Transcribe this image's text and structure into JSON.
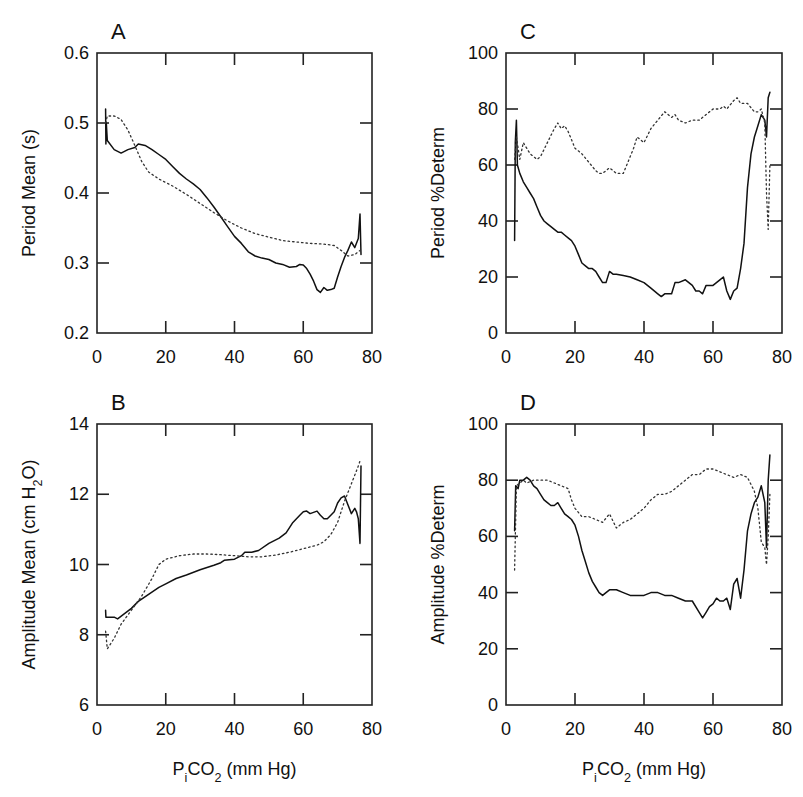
{
  "figure": {
    "panels": [
      "A",
      "B",
      "C",
      "D"
    ],
    "x_axis_label": "PiCO2 (mm Hg)"
  },
  "chart_data": [
    {
      "panel": "A",
      "type": "line",
      "title": "A",
      "xlabel": "",
      "ylabel": "Period  Mean (s)",
      "xlim": [
        0,
        80
      ],
      "ylim": [
        0.2,
        0.6
      ],
      "xticks": [
        0,
        20,
        40,
        60,
        80
      ],
      "yticks": [
        0.2,
        0.3,
        0.4,
        0.5,
        0.6
      ],
      "ytick_labels": [
        "0.2",
        "0.3",
        "0.4",
        "0.5",
        "0.6"
      ],
      "grid": false,
      "series": [
        {
          "name": "solid",
          "style": "solid",
          "x": [
            2.5,
            2.6,
            2.7,
            3,
            5,
            7,
            9,
            11,
            12,
            14,
            16,
            18,
            20,
            22,
            24,
            26,
            28,
            30,
            32,
            34,
            36,
            38,
            40,
            42,
            44,
            46,
            48,
            50,
            52,
            54,
            56,
            58,
            59,
            60,
            61,
            62,
            63,
            64,
            65,
            66,
            67,
            68,
            69,
            70,
            71,
            72,
            73,
            74,
            75,
            76,
            76.5,
            76.8
          ],
          "y": [
            0.52,
            0.47,
            0.5,
            0.475,
            0.462,
            0.457,
            0.462,
            0.465,
            0.47,
            0.468,
            0.462,
            0.455,
            0.448,
            0.438,
            0.428,
            0.42,
            0.413,
            0.405,
            0.393,
            0.38,
            0.366,
            0.352,
            0.338,
            0.328,
            0.316,
            0.31,
            0.307,
            0.305,
            0.3,
            0.298,
            0.294,
            0.295,
            0.298,
            0.297,
            0.292,
            0.284,
            0.274,
            0.262,
            0.258,
            0.265,
            0.261,
            0.262,
            0.264,
            0.28,
            0.295,
            0.308,
            0.318,
            0.33,
            0.322,
            0.335,
            0.37,
            0.312
          ]
        },
        {
          "name": "dotted",
          "style": "dotted",
          "x": [
            2.5,
            3,
            5,
            7,
            9,
            11,
            13,
            15,
            18,
            22,
            26,
            30,
            34,
            38,
            42,
            46,
            50,
            54,
            58,
            62,
            66,
            69,
            71,
            73,
            75,
            76.5
          ],
          "y": [
            0.5,
            0.51,
            0.51,
            0.505,
            0.49,
            0.468,
            0.445,
            0.43,
            0.42,
            0.41,
            0.398,
            0.385,
            0.372,
            0.36,
            0.35,
            0.342,
            0.337,
            0.332,
            0.33,
            0.328,
            0.327,
            0.325,
            0.318,
            0.31,
            0.312,
            0.318
          ]
        }
      ]
    },
    {
      "panel": "B",
      "type": "line",
      "title": "B",
      "xlabel": "PiCO2 (mm Hg)",
      "ylabel": "Amplitude  Mean (cm H2O)",
      "xlim": [
        0,
        80
      ],
      "ylim": [
        6,
        14
      ],
      "xticks": [
        0,
        20,
        40,
        60,
        80
      ],
      "yticks": [
        6,
        8,
        10,
        12,
        14
      ],
      "ytick_labels": [
        "6",
        "8",
        "10",
        "12",
        "14"
      ],
      "grid": false,
      "series": [
        {
          "name": "solid",
          "style": "solid",
          "x": [
            2.5,
            2.6,
            3,
            5,
            6,
            8,
            10,
            12,
            15,
            18,
            20,
            23,
            26,
            30,
            34,
            36,
            37,
            40,
            42,
            43,
            45,
            47,
            50,
            53,
            55,
            57,
            59,
            60,
            61,
            62,
            64,
            65,
            66,
            67,
            68,
            69,
            70,
            71,
            72,
            73,
            74,
            75,
            75.5,
            76,
            76.5,
            76.8
          ],
          "y": [
            8.7,
            8.5,
            8.5,
            8.5,
            8.45,
            8.6,
            8.75,
            8.95,
            9.15,
            9.35,
            9.45,
            9.6,
            9.7,
            9.85,
            9.98,
            10.05,
            10.12,
            10.15,
            10.25,
            10.35,
            10.35,
            10.4,
            10.6,
            10.75,
            10.9,
            11.2,
            11.4,
            11.5,
            11.52,
            11.45,
            11.52,
            11.4,
            11.3,
            11.3,
            11.4,
            11.5,
            11.75,
            11.9,
            11.95,
            11.7,
            11.45,
            11.6,
            11.5,
            11.3,
            10.6,
            12.8
          ]
        },
        {
          "name": "dotted",
          "style": "dotted",
          "x": [
            2.5,
            3,
            5,
            7,
            10,
            13,
            16,
            18,
            20,
            24,
            28,
            32,
            36,
            40,
            44,
            48,
            52,
            56,
            60,
            64,
            66,
            68,
            70,
            72,
            74,
            76,
            76.5
          ],
          "y": [
            8.1,
            7.6,
            7.9,
            8.3,
            8.7,
            9.1,
            9.6,
            10.0,
            10.15,
            10.25,
            10.3,
            10.3,
            10.28,
            10.25,
            10.22,
            10.22,
            10.27,
            10.35,
            10.45,
            10.55,
            10.65,
            10.85,
            11.2,
            11.8,
            12.3,
            12.8,
            12.95
          ]
        }
      ]
    },
    {
      "panel": "C",
      "type": "line",
      "title": "C",
      "xlabel": "",
      "ylabel": "Period  %Determ",
      "xlim": [
        0,
        80
      ],
      "ylim": [
        0,
        100
      ],
      "xticks": [
        0,
        20,
        40,
        60,
        80
      ],
      "yticks": [
        0,
        20,
        40,
        60,
        80,
        100
      ],
      "ytick_labels": [
        "0",
        "20",
        "40",
        "60",
        "80",
        "100"
      ],
      "grid": false,
      "series": [
        {
          "name": "solid",
          "style": "solid",
          "x": [
            2.5,
            2.7,
            3,
            3.3,
            4,
            5,
            6,
            7,
            8,
            9,
            10,
            11,
            12,
            13,
            14,
            15,
            16,
            17,
            18,
            19,
            20,
            21,
            22,
            23,
            24,
            25,
            26,
            27,
            28,
            29,
            30,
            31,
            32,
            34,
            36,
            38,
            40,
            42,
            44,
            45,
            46,
            48,
            49,
            50,
            52,
            54,
            55,
            56,
            57,
            58,
            60,
            62,
            63,
            64,
            65,
            66,
            67,
            68,
            69,
            70,
            71,
            72,
            73,
            74,
            75,
            75.5,
            76,
            76.5
          ],
          "y": [
            33,
            68,
            76,
            60,
            57,
            54,
            52,
            50,
            48,
            45,
            42,
            40,
            39,
            38,
            37,
            36,
            36,
            35,
            34,
            33,
            31,
            28,
            25,
            24,
            23,
            23,
            22,
            20,
            18,
            18,
            22,
            21,
            21,
            20.5,
            20,
            19,
            18,
            16,
            14,
            13,
            14,
            14,
            18,
            18,
            19,
            17,
            15,
            15,
            14,
            17,
            17,
            19,
            20,
            15,
            12,
            15,
            16,
            23,
            32,
            52,
            64,
            70,
            74,
            78,
            76,
            70,
            84,
            86
          ]
        },
        {
          "name": "dotted",
          "style": "dotted",
          "x": [
            2.5,
            3,
            4,
            5,
            6,
            7,
            8,
            9,
            10,
            12,
            14,
            15,
            16,
            17,
            18,
            20,
            22,
            24,
            26,
            27,
            28,
            30,
            32,
            34,
            36,
            37,
            38,
            39,
            40,
            42,
            44,
            46,
            48,
            49,
            50,
            52,
            54,
            56,
            58,
            60,
            62,
            63,
            64,
            66,
            67,
            68,
            70,
            72,
            73,
            74,
            75,
            75.5,
            76,
            76.5
          ],
          "y": [
            62,
            70,
            62,
            68,
            66,
            64,
            63,
            62,
            63,
            68,
            73,
            75,
            73,
            74,
            72,
            66,
            64,
            61,
            58,
            57,
            57,
            59,
            57,
            57,
            63,
            66,
            70,
            69,
            68,
            73,
            76,
            79,
            77,
            78,
            76,
            75,
            76,
            76,
            78,
            80,
            80,
            81,
            80,
            83,
            84,
            82,
            82,
            79,
            79,
            80,
            75,
            50,
            37,
            60
          ]
        }
      ]
    },
    {
      "panel": "D",
      "type": "line",
      "title": "D",
      "xlabel": "PiCO2 (mm Hg)",
      "ylabel": "Amplitude  %Determ",
      "xlim": [
        0,
        80
      ],
      "ylim": [
        0,
        100
      ],
      "xticks": [
        0,
        20,
        40,
        60,
        80
      ],
      "yticks": [
        0,
        20,
        40,
        60,
        80,
        100
      ],
      "ytick_labels": [
        "0",
        "20",
        "40",
        "60",
        "80",
        "100"
      ],
      "grid": false,
      "series": [
        {
          "name": "solid",
          "style": "solid",
          "x": [
            2.5,
            2.8,
            3.5,
            4,
            5,
            6,
            7,
            8,
            9,
            10,
            11,
            12,
            13,
            14,
            15,
            16,
            17,
            18,
            19,
            20,
            21,
            22,
            23,
            24,
            25,
            26,
            27,
            28,
            29,
            30,
            32,
            34,
            36,
            38,
            40,
            42,
            44,
            46,
            48,
            50,
            52,
            54,
            56,
            57,
            58,
            59,
            60,
            61,
            62,
            63,
            64,
            65,
            66,
            67,
            68,
            69,
            70,
            71,
            72,
            73,
            74,
            75,
            75.5,
            76,
            76.5
          ],
          "y": [
            62,
            78,
            77,
            80,
            80,
            81,
            80,
            78,
            77,
            75,
            73,
            72,
            71,
            71,
            72,
            70,
            68,
            67,
            66,
            64,
            60,
            55,
            51,
            47,
            44,
            42,
            40,
            39,
            40,
            41,
            41,
            40,
            39,
            39,
            39,
            40,
            40,
            39,
            39,
            38,
            37,
            37,
            33,
            31,
            33,
            35,
            36,
            38,
            37,
            37,
            38,
            34,
            43,
            45,
            38,
            48,
            62,
            68,
            72,
            74,
            78,
            72,
            56,
            80,
            89
          ]
        },
        {
          "name": "dotted",
          "style": "dotted",
          "x": [
            2.5,
            3,
            4,
            5,
            6,
            8,
            10,
            12,
            14,
            16,
            18,
            19,
            20,
            22,
            24,
            26,
            28,
            30,
            32,
            34,
            36,
            38,
            40,
            42,
            44,
            46,
            48,
            50,
            52,
            54,
            56,
            58,
            60,
            62,
            64,
            66,
            68,
            70,
            72,
            73,
            74,
            75,
            75.5,
            76,
            76.5
          ],
          "y": [
            48,
            78,
            79,
            80,
            79,
            80,
            80,
            80,
            79,
            78,
            77,
            73,
            70,
            67,
            67,
            66,
            65,
            68,
            63,
            65,
            66,
            68,
            70,
            73,
            75,
            75,
            76,
            78,
            80,
            82,
            82,
            84,
            84,
            83,
            82,
            81,
            82,
            81,
            76,
            70,
            58,
            56,
            50,
            60,
            75
          ]
        }
      ]
    }
  ]
}
